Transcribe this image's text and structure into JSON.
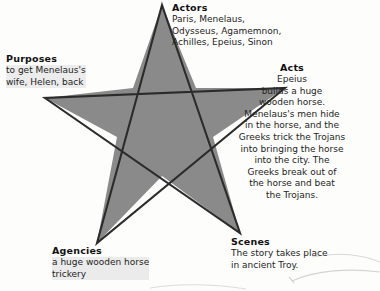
{
  "diagram": {
    "shape": "pentagram-star",
    "star_fill": "#8a8a8a",
    "star_stroke": "#2b2b2b",
    "background": "#fdfdfc",
    "highlight_color": "#e9e9e9"
  },
  "blocks": {
    "actors": {
      "heading": "Actors",
      "lines": [
        "Paris, Menelaus,",
        "Odysseus, Agamemnon,",
        "Achilles, Epeius, Sinon"
      ]
    },
    "purposes": {
      "heading": "Purposes",
      "lines": [
        "to get Menelaus's",
        "wife, Helen, back"
      ]
    },
    "acts": {
      "heading": "Acts",
      "lines": [
        "Epeius",
        "builds a huge",
        "wooden horse.",
        "Menelaus's men hide",
        "in the horse, and the",
        "Greeks trick the Trojans",
        "into bringing the horse",
        "into the city. The",
        "Greeks break out of",
        "the horse and beat",
        "the Trojans."
      ]
    },
    "agencies": {
      "heading": "Agencies",
      "lines": [
        "a huge wooden horse",
        "trickery"
      ]
    },
    "scenes": {
      "heading": "Scenes",
      "lines": [
        "The story takes place",
        "in ancient Troy."
      ]
    }
  }
}
